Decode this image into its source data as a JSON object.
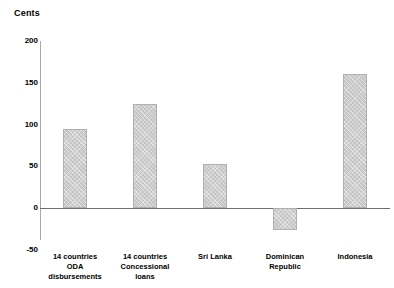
{
  "chart_data": {
    "type": "bar",
    "title": "",
    "ylabel": "Cents",
    "xlabel": "",
    "ylim": [
      -50,
      200
    ],
    "yticks": [
      200,
      150,
      100,
      50,
      0,
      -50
    ],
    "ytick_labels": [
      "200",
      "150",
      "100",
      "50",
      "0",
      "-50"
    ],
    "grid": false,
    "legend": false,
    "categories": [
      "14 countries\nODA disbursements",
      "14 countries\nConcessional\nloans",
      "Sri Lanka",
      "Dominican\nRepublic",
      "Indonesia"
    ],
    "values": [
      95,
      125,
      53,
      -26,
      160
    ],
    "bar_color": "#c4c4c4",
    "bar_border_color": "#b0b0b0",
    "axis_color": "#6e6e6e"
  }
}
